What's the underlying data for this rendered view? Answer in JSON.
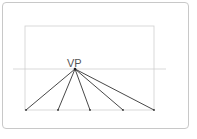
{
  "diagram": {
    "vanishing_point": {
      "label": "VP",
      "x": 75,
      "y": 69
    },
    "horizon_line": {
      "x1": 13,
      "x2": 166,
      "y": 69
    },
    "picture_plane": {
      "x": 25,
      "y": 26,
      "width": 129,
      "height": 84
    },
    "ground_points": [
      26,
      58,
      90,
      123,
      154
    ],
    "ground_y": 110,
    "colors": {
      "lines": "#333333",
      "guides": "#c8c8c8",
      "label": "#555555"
    }
  }
}
